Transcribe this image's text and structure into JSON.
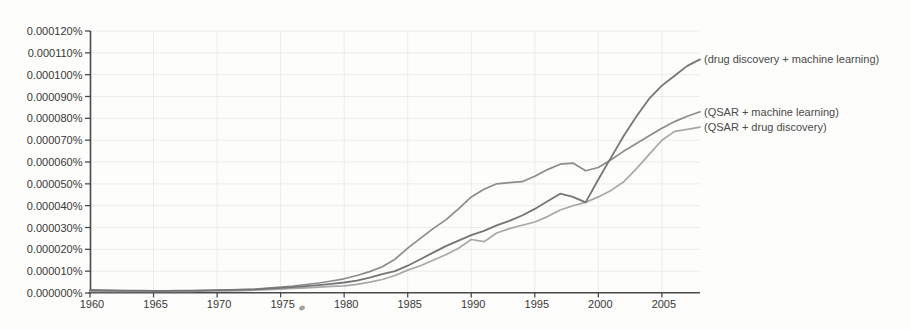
{
  "page": {
    "background": "#fdfdfb"
  },
  "chart_data": {
    "type": "line",
    "title": "",
    "xlabel": "",
    "ylabel": "",
    "grid": true,
    "legend_position": "right-of-line-ends",
    "x_range": [
      1960,
      2008
    ],
    "y_range_percent": [
      0.0,
      0.00012
    ],
    "x_ticks": [
      {
        "v": 1960,
        "label": "1960"
      },
      {
        "v": 1965,
        "label": "1965"
      },
      {
        "v": 1970,
        "label": "1970"
      },
      {
        "v": 1975,
        "label": "1975"
      },
      {
        "v": 1980,
        "label": "1980"
      },
      {
        "v": 1985,
        "label": "1985"
      },
      {
        "v": 1990,
        "label": "1990"
      },
      {
        "v": 1995,
        "label": "1995"
      },
      {
        "v": 2000,
        "label": "2000"
      },
      {
        "v": 2005,
        "label": "2005"
      }
    ],
    "y_ticks": [
      {
        "v": 0,
        "label": "0.000000%"
      },
      {
        "v": 10,
        "label": "0.000010%"
      },
      {
        "v": 20,
        "label": "0.000020%"
      },
      {
        "v": 30,
        "label": "0.000030%"
      },
      {
        "v": 40,
        "label": "0.000040%"
      },
      {
        "v": 50,
        "label": "0.000050%"
      },
      {
        "v": 60,
        "label": "0.000060%"
      },
      {
        "v": 70,
        "label": "0.000070%"
      },
      {
        "v": 80,
        "label": "0.000080%"
      },
      {
        "v": 90,
        "label": "0.000090%"
      },
      {
        "v": 100,
        "label": "0.000100%"
      },
      {
        "v": 110,
        "label": "0.000110%"
      },
      {
        "v": 120,
        "label": "0.000120%"
      }
    ],
    "value_unit": "1e-6 percent",
    "years": [
      1960,
      1961,
      1962,
      1963,
      1964,
      1965,
      1966,
      1967,
      1968,
      1969,
      1970,
      1971,
      1972,
      1973,
      1974,
      1975,
      1976,
      1977,
      1978,
      1979,
      1980,
      1981,
      1982,
      1983,
      1984,
      1985,
      1986,
      1987,
      1988,
      1989,
      1990,
      1991,
      1992,
      1993,
      1994,
      1995,
      1996,
      1997,
      1998,
      1999,
      2000,
      2001,
      2002,
      2003,
      2004,
      2005,
      2006,
      2007,
      2008
    ],
    "series": [
      {
        "name": "QSAR + drug discovery",
        "label": "(QSAR + drug discovery)",
        "color": "#a8a8a8",
        "width": 1.7,
        "values": [
          0.8,
          0.8,
          0.7,
          0.7,
          0.7,
          0.7,
          0.7,
          0.8,
          0.8,
          0.9,
          0.9,
          1.0,
          1.1,
          1.3,
          1.5,
          1.8,
          2.1,
          2.4,
          2.7,
          3.0,
          3.3,
          4.0,
          5.0,
          6.2,
          8.0,
          10.5,
          12.5,
          15.0,
          17.5,
          20.5,
          24.5,
          23.5,
          27.5,
          29.5,
          31.0,
          32.5,
          35.0,
          38.0,
          40.0,
          41.5,
          44.0,
          47.0,
          51.0,
          57.0,
          63.5,
          70.0,
          74.0,
          75.0,
          76.0
        ]
      },
      {
        "name": "QSAR + machine learning",
        "label": "(QSAR + machine learning)",
        "color": "#8c8c8c",
        "width": 1.7,
        "values": [
          1.1,
          1.0,
          0.9,
          0.9,
          0.9,
          0.9,
          0.9,
          1.0,
          1.0,
          1.1,
          1.2,
          1.3,
          1.5,
          1.8,
          2.2,
          2.7,
          3.2,
          3.9,
          4.6,
          5.5,
          6.5,
          8.0,
          9.8,
          12.0,
          15.5,
          20.5,
          25.0,
          29.5,
          33.5,
          38.5,
          44.0,
          47.5,
          50.0,
          50.5,
          51.0,
          53.5,
          56.5,
          59.0,
          59.5,
          56.0,
          57.5,
          61.0,
          65.0,
          68.5,
          72.0,
          75.5,
          78.5,
          81.0,
          83.0
        ]
      },
      {
        "name": "drug discovery + machine learning",
        "label": "(drug discovery + machine learning)",
        "color": "#757575",
        "width": 1.8,
        "values": [
          1.4,
          1.3,
          1.2,
          1.1,
          1.1,
          1.0,
          1.0,
          1.1,
          1.1,
          1.2,
          1.3,
          1.4,
          1.5,
          1.7,
          2.0,
          2.4,
          2.7,
          3.1,
          3.6,
          4.2,
          4.8,
          5.7,
          7.0,
          8.6,
          10.0,
          12.5,
          15.5,
          18.5,
          21.5,
          24.0,
          26.5,
          28.5,
          31.0,
          33.0,
          35.5,
          38.5,
          42.0,
          45.5,
          44.0,
          41.5,
          52.0,
          62.0,
          72.0,
          81.0,
          89.0,
          95.0,
          99.5,
          104.0,
          107.0
        ]
      }
    ],
    "style": {
      "axis_color": "#4a4a4a",
      "tick_label_color": "#383838",
      "grid_color": "#ececе8",
      "grid_color_hex": "#ececEA",
      "series_label_color": "#4a4a4a",
      "speck_color": "#8f8f8f"
    }
  },
  "layout": {
    "plot": {
      "left": 90.5,
      "right": 700,
      "top": 31,
      "bottom": 293
    },
    "speck": {
      "x": 302,
      "y": 308
    }
  }
}
